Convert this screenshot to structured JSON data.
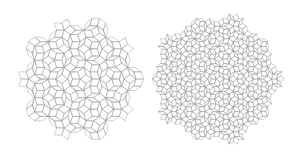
{
  "figure": {
    "background": "#ffffff",
    "line_color": "#9a9a9a",
    "panels": [
      {
        "name": "left-tiling",
        "description": "Decagonal quasicrystal (Penrose-style) rhombus tiling with overlaid circular arcs",
        "center": [
          80,
          79
        ],
        "radius": 60,
        "symmetry": 10,
        "tile_scale": 7.5
      },
      {
        "name": "right-tiling",
        "description": "Finer decagonal quasicrystal rhombus tiling",
        "center": [
          216,
          79
        ],
        "radius": 65,
        "symmetry": 10,
        "tile_scale": 5
      }
    ]
  }
}
